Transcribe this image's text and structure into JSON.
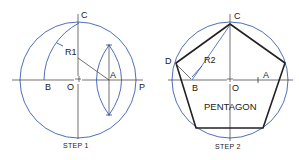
{
  "step1": {
    "caption": "STEP 1",
    "labels": {
      "C": "C",
      "R1": "R1",
      "A": "A",
      "B": "B",
      "O": "O",
      "P": "P"
    },
    "circle": {
      "cx": 78,
      "cy": 80,
      "r": 58
    }
  },
  "step2": {
    "caption": "STEP 2",
    "title": "PENTAGON",
    "labels": {
      "C": "C",
      "R2": "R2",
      "D": "D",
      "A": "A",
      "B": "B",
      "O": "O"
    },
    "circle": {
      "cx": 230,
      "cy": 80,
      "r": 58
    }
  },
  "colors": {
    "construction": "#3a5fb0",
    "outline": "#222222"
  }
}
